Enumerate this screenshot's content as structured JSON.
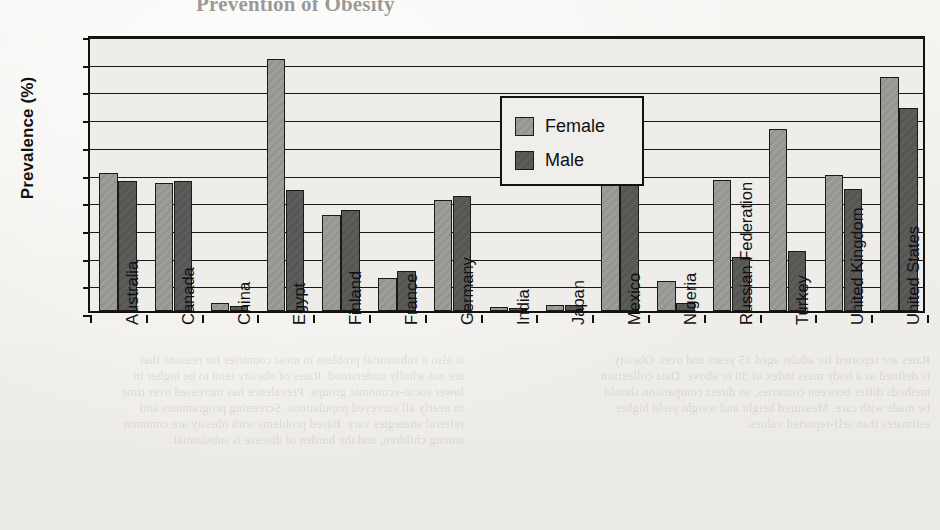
{
  "page": {
    "background_color": "#f2f1ee",
    "bleed_through_title": "Prevention of Obesity",
    "bleed_through_left": "is also a substantial problem in most countries for reasons that\nare not wholly understood. Rates of obesity tend to be higher in\nlower socio-economic groups. Prevalence has increased over time\nin nearly all surveyed populations. Screening programmes and\nreferral strategies vary. Based problems with obesity are common\namong children, and the burden of disease is substantial.",
    "bleed_through_right": "Rates are reported for adults aged 15 years and over. Obesity\nis defined as a body mass index of 30 or above. Data collection\nmethods differ between countries, so direct comparison should\nbe made with care. Measured height and weight yield higher\nestimates than self-reported values.",
    "bleed_through_mid_a": "An Overview of Obesity",
    "bleed_through_mid_b": "Prevalence Worldwide"
  },
  "chart_data": {
    "type": "bar",
    "xlabel": "",
    "ylabel": "Prevalence (%)",
    "ylim": [
      0,
      50
    ],
    "ytick_step": 5,
    "yticks": [
      0,
      5,
      10,
      15,
      20,
      25,
      30,
      35,
      40,
      45,
      50
    ],
    "grid": true,
    "grid_axis": "y",
    "legend_position": "upper-center",
    "categories": [
      "Australia",
      "Canada",
      "China",
      "Egypt",
      "Finland",
      "France",
      "Germany",
      "India",
      "Japan",
      "Mexico",
      "Nigeria",
      "Russian Federation",
      "Turkey",
      "United Kingdom",
      "United States"
    ],
    "series": [
      {
        "name": "Female",
        "color": "#9a9a98",
        "values": [
          24.9,
          23.1,
          1.4,
          45.5,
          17.3,
          6.0,
          20.0,
          0.7,
          1.0,
          34.3,
          5.5,
          23.6,
          32.8,
          24.5,
          42.3
        ]
      },
      {
        "name": "Male",
        "color": "#5a5a58",
        "values": [
          23.4,
          23.5,
          0.9,
          21.9,
          18.3,
          7.3,
          20.8,
          0.5,
          1.0,
          23.8,
          1.5,
          9.7,
          10.8,
          22.0,
          36.7
        ]
      }
    ],
    "axis_color": "#14120f",
    "plot_background": "#eeedea"
  }
}
